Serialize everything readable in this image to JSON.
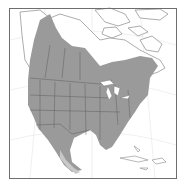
{
  "map": {
    "type": "range-map",
    "region": "North America",
    "colors": {
      "background": "#ffffff",
      "frame": "#6e6e6e",
      "land_outline": "#8a8a8a",
      "graticule": "#e6e6e6",
      "range_fill": "#9a9a9a",
      "range_fill_light": "#c8c8c8",
      "state_border": "#5f5f5f"
    },
    "legend": []
  }
}
